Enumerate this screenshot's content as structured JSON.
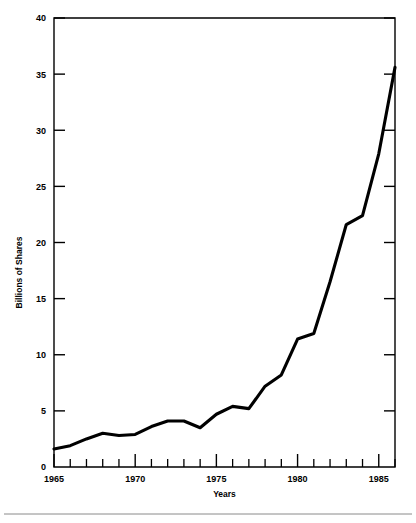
{
  "chart_data": {
    "type": "line",
    "title": "",
    "subtitle": "",
    "xlabel": "Years",
    "ylabel": "Billions of Shares",
    "xlim": [
      1965,
      1986
    ],
    "ylim": [
      0,
      40
    ],
    "grid": false,
    "legend": null,
    "y_ticks": [
      0,
      5,
      10,
      15,
      20,
      25,
      30,
      35,
      40
    ],
    "y_tick_labels": [
      "0",
      "5",
      "10",
      "15",
      "20",
      "25",
      "30",
      "35",
      "40"
    ],
    "x_ticks": [
      1965,
      1966,
      1967,
      1968,
      1969,
      1970,
      1971,
      1972,
      1973,
      1974,
      1975,
      1976,
      1977,
      1978,
      1979,
      1980,
      1981,
      1982,
      1983,
      1984,
      1985,
      1986
    ],
    "x_tick_labels_major": [
      "1965",
      "1970",
      "1975",
      "1980",
      "1985"
    ],
    "x_major_ticks": [
      1965,
      1970,
      1975,
      1980,
      1985
    ],
    "x": [
      1965,
      1966,
      1967,
      1968,
      1969,
      1970,
      1971,
      1972,
      1973,
      1974,
      1975,
      1976,
      1977,
      1978,
      1979,
      1980,
      1981,
      1982,
      1983,
      1984,
      1985,
      1986
    ],
    "values": [
      1.6,
      1.9,
      2.5,
      3.0,
      2.8,
      2.9,
      3.6,
      4.1,
      4.1,
      3.5,
      4.7,
      5.4,
      5.2,
      7.2,
      8.2,
      11.4,
      11.9,
      16.5,
      21.6,
      22.4,
      27.9,
      35.6
    ],
    "series": [
      {
        "name": "Billions of Shares",
        "values": [
          1.6,
          1.9,
          2.5,
          3.0,
          2.8,
          2.9,
          3.6,
          4.1,
          4.1,
          3.5,
          4.7,
          5.4,
          5.2,
          7.2,
          8.2,
          11.4,
          11.9,
          16.5,
          21.6,
          22.4,
          27.9,
          35.6
        ]
      }
    ],
    "line_color": "#000000",
    "background_color": "#ffffff"
  }
}
